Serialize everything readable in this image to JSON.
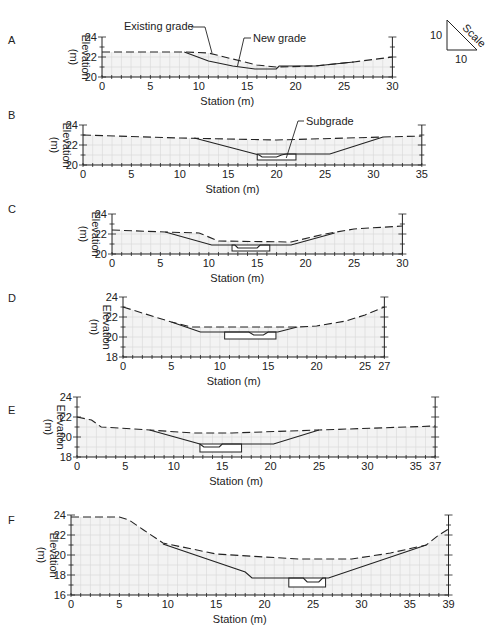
{
  "figure": {
    "scale_label": "Scale",
    "scale_vertical": "10",
    "scale_horizontal": "10"
  },
  "chart_data": [
    {
      "type": "line",
      "panel": "A",
      "xlabel": "Station (m)",
      "ylabel": "Elevation (m)",
      "xlim": [
        0,
        30
      ],
      "ylim": [
        20,
        24
      ],
      "xticks": [
        0,
        5,
        10,
        15,
        20,
        25,
        30
      ],
      "xtick_labels": [
        "0",
        "5",
        "10",
        "15",
        "20",
        "25",
        "30"
      ],
      "yticks": [
        20,
        22,
        24
      ],
      "grid": true,
      "annotations": [
        {
          "text": "Existing grade",
          "points_to": [
            11,
            22.4
          ]
        },
        {
          "text": "New grade",
          "points_to": [
            14,
            21.1
          ]
        }
      ],
      "series": [
        {
          "name": "Existing grade",
          "style": "dashed",
          "x": [
            0,
            8.5,
            11,
            16,
            18,
            22,
            26,
            30
          ],
          "y": [
            22.5,
            22.5,
            22.4,
            21.2,
            21.0,
            21.1,
            21.5,
            22.0
          ]
        },
        {
          "name": "New grade",
          "style": "solid",
          "x": [
            8.5,
            11,
            13.5,
            15.8,
            18,
            18.3,
            22,
            26
          ],
          "y": [
            22.5,
            21.6,
            21.1,
            20.8,
            20.8,
            21.1,
            21.1,
            21.5
          ]
        }
      ],
      "subgrade": null
    },
    {
      "type": "line",
      "panel": "B",
      "xlabel": "Station (m)",
      "ylabel": "Elevation (m)",
      "xlim": [
        0,
        35
      ],
      "ylim": [
        20,
        24
      ],
      "xticks": [
        0,
        5,
        10,
        15,
        20,
        25,
        30,
        35
      ],
      "xtick_labels": [
        "0",
        "5",
        "10",
        "15",
        "20",
        "25",
        "30",
        "35"
      ],
      "yticks": [
        20,
        22,
        24
      ],
      "grid": true,
      "annotations": [
        {
          "text": "Subgrade",
          "points_to": [
            21,
            20.7
          ]
        }
      ],
      "series": [
        {
          "name": "Existing grade",
          "style": "dashed",
          "x": [
            0,
            10,
            20,
            31,
            35
          ],
          "y": [
            23.0,
            22.7,
            22.5,
            22.8,
            22.9
          ]
        },
        {
          "name": "New grade",
          "style": "solid",
          "x": [
            11.5,
            17.8,
            18.2,
            18.5,
            20,
            20.5,
            21,
            25.5,
            31
          ],
          "y": [
            22.7,
            21.1,
            21.0,
            20.8,
            20.8,
            21.0,
            21.1,
            21.1,
            22.8
          ]
        }
      ],
      "subgrade": {
        "x": [
          18,
          22
        ],
        "y": [
          20.5,
          21.1
        ]
      }
    },
    {
      "type": "line",
      "panel": "C",
      "xlabel": "Station (m)",
      "ylabel": "Elevation (m)",
      "xlim": [
        0,
        30
      ],
      "ylim": [
        20,
        24
      ],
      "xticks": [
        0,
        5,
        10,
        15,
        20,
        25,
        30
      ],
      "xtick_labels": [
        "0",
        "5",
        "10",
        "15",
        "20",
        "25",
        "30"
      ],
      "yticks": [
        20,
        22,
        24
      ],
      "grid": true,
      "annotations": [],
      "series": [
        {
          "name": "Existing grade",
          "style": "dashed",
          "x": [
            0,
            5.5,
            9,
            11,
            18.5,
            22,
            25,
            30
          ],
          "y": [
            22.4,
            22.2,
            22.1,
            21.3,
            21.2,
            22.0,
            22.5,
            22.8
          ]
        },
        {
          "name": "New grade",
          "style": "solid",
          "x": [
            5.5,
            10.3,
            12.7,
            13,
            15,
            15.3,
            18.5,
            23
          ],
          "y": [
            22.2,
            20.9,
            20.9,
            20.6,
            20.6,
            20.9,
            20.9,
            22.1
          ]
        }
      ],
      "subgrade": {
        "x": [
          12.4,
          16.3
        ],
        "y": [
          20.3,
          20.9
        ]
      }
    },
    {
      "type": "line",
      "panel": "D",
      "xlabel": "Station (m)",
      "ylabel": "Elevation (m)",
      "xlim": [
        0,
        27
      ],
      "ylim": [
        18,
        24
      ],
      "xticks": [
        0,
        5,
        10,
        15,
        20,
        25,
        27
      ],
      "xtick_labels": [
        "0",
        "5",
        "10",
        "15",
        "20",
        "25",
        "27"
      ],
      "yticks": [
        18,
        20,
        22,
        24
      ],
      "grid": true,
      "annotations": [],
      "series": [
        {
          "name": "Existing grade",
          "style": "dashed",
          "x": [
            0,
            5,
            7,
            18,
            20,
            23,
            25,
            27
          ],
          "y": [
            23.0,
            21.5,
            21.0,
            21.0,
            21.1,
            21.6,
            22.2,
            23.0
          ]
        },
        {
          "name": "New grade",
          "style": "solid",
          "x": [
            5,
            8,
            13,
            13.5,
            14.5,
            15,
            16,
            18
          ],
          "y": [
            21.5,
            20.5,
            20.5,
            20.2,
            20.2,
            20.5,
            20.5,
            21.0
          ]
        }
      ],
      "subgrade": {
        "x": [
          10.5,
          15.8
        ],
        "y": [
          19.8,
          20.5
        ]
      }
    },
    {
      "type": "line",
      "panel": "E",
      "xlabel": "Station (m)",
      "ylabel": "Elevation (m)",
      "xlim": [
        0,
        37
      ],
      "ylim": [
        18,
        24
      ],
      "xticks": [
        0,
        5,
        10,
        15,
        20,
        25,
        30,
        35,
        37
      ],
      "xtick_labels": [
        "0",
        "5",
        "10",
        "15",
        "20",
        "25",
        "30",
        "35",
        "37"
      ],
      "yticks": [
        18,
        20,
        22,
        24
      ],
      "grid": true,
      "annotations": [],
      "series": [
        {
          "name": "Existing grade",
          "style": "dashed",
          "x": [
            0,
            1.5,
            2.5,
            7.5,
            12,
            16,
            25,
            37
          ],
          "y": [
            22.0,
            21.7,
            21.0,
            20.7,
            20.4,
            20.4,
            20.7,
            21.1
          ]
        },
        {
          "name": "New grade",
          "style": "solid",
          "x": [
            7.5,
            12.7,
            13.1,
            14.7,
            15,
            20.3,
            25
          ],
          "y": [
            20.7,
            19.3,
            19.0,
            19.0,
            19.3,
            19.3,
            20.7
          ]
        }
      ],
      "subgrade": {
        "x": [
          12.7,
          17
        ],
        "y": [
          18.5,
          19.3
        ]
      }
    },
    {
      "type": "line",
      "panel": "F",
      "xlabel": "Station (m)",
      "ylabel": "Elevation (m)",
      "xlim": [
        0,
        39
      ],
      "ylim": [
        16,
        24
      ],
      "xticks": [
        0,
        5,
        10,
        15,
        20,
        25,
        30,
        35,
        39
      ],
      "xtick_labels": [
        "0",
        "5",
        "10",
        "15",
        "20",
        "25",
        "30",
        "35",
        "39"
      ],
      "yticks": [
        16,
        18,
        20,
        22,
        24
      ],
      "grid": true,
      "annotations": [],
      "series": [
        {
          "name": "Existing grade",
          "style": "dashed",
          "x": [
            0,
            5,
            6,
            7.5,
            9.5,
            15,
            20,
            23.5,
            29,
            33,
            36.7,
            38,
            39
          ],
          "y": [
            23.8,
            23.8,
            23.5,
            22.5,
            21.2,
            20.1,
            19.8,
            19.6,
            19.6,
            20.2,
            21.0,
            22.0,
            22.6
          ]
        },
        {
          "name": "New grade",
          "style": "solid",
          "x": [
            9.5,
            18,
            18.7,
            24,
            24.4,
            25.6,
            26,
            26.6,
            36.7
          ],
          "y": [
            21.1,
            18.3,
            17.7,
            17.7,
            17.3,
            17.3,
            17.7,
            17.7,
            21.0
          ]
        }
      ],
      "subgrade": {
        "x": [
          22.5,
          26.3
        ],
        "y": [
          16.8,
          17.7
        ]
      }
    }
  ]
}
